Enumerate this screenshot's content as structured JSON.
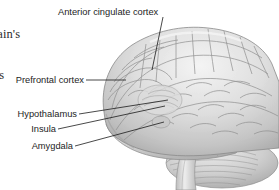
{
  "figure": {
    "heading": {
      "line1": "rain's",
      "line2": "us",
      "note": "cropped serif heading at top-left edge"
    },
    "background_color": "#ffffff",
    "illustration": {
      "name": "human-brain-lateral-view",
      "style": "grayscale anatomical drawing",
      "base_color": "#d8d8d8",
      "highlight_color": "#f2f2f2",
      "shadow_color": "#9a9a9a",
      "outline_color": "#8c8c8c",
      "parts": [
        "cerebral cortex",
        "frontal lobe",
        "temporal lobe",
        "parietal lobe",
        "occipital lobe",
        "cerebellum",
        "brainstem"
      ]
    },
    "leader_line_color": "#1a1a1a",
    "labels": [
      {
        "id": "anterior-cingulate-cortex",
        "text": "Anterior cingulate cortex",
        "align": "left",
        "x": 58,
        "y": 7
      },
      {
        "id": "prefrontal-cortex",
        "text": "Prefrontal cortex",
        "align": "right",
        "x": 2,
        "y": 76
      },
      {
        "id": "hypothalamus",
        "text": "Hypothalamus",
        "align": "right",
        "x": 2,
        "y": 110
      },
      {
        "id": "insula",
        "text": "Insula",
        "align": "right",
        "x": 2,
        "y": 125
      },
      {
        "id": "amygdala",
        "text": "Amygdala",
        "align": "right",
        "x": 2,
        "y": 142
      }
    ]
  }
}
